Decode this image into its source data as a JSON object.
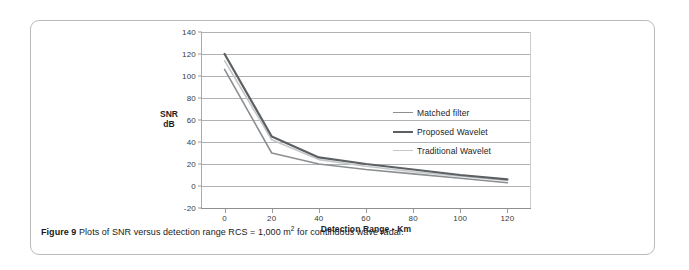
{
  "figure": {
    "caption_label": "Figure 9",
    "caption_text": "Plots of SNR versus detection range RCS = 1,000 m",
    "caption_superscript": "2",
    "caption_tail": " for continuous wave radar."
  },
  "chart_data": {
    "type": "line",
    "title": "",
    "xlabel": "Detection Range - Km",
    "ylabel": "SNR\ndB",
    "ylabel_line1": "SNR",
    "ylabel_line2": "dB",
    "x": [
      0,
      20,
      40,
      60,
      80,
      100,
      120
    ],
    "xlim": [
      -10,
      130
    ],
    "ylim": [
      -20,
      140
    ],
    "xticks": [
      0,
      20,
      40,
      60,
      80,
      100,
      120
    ],
    "yticks": [
      -20,
      0,
      20,
      40,
      60,
      80,
      100,
      120,
      140
    ],
    "grid": "horizontal",
    "legend_position": "inside-right",
    "series": [
      {
        "name": "Matched filter",
        "color": "#8c8f91",
        "width": 1.6,
        "values": [
          106,
          30,
          20,
          15,
          11,
          7,
          3
        ]
      },
      {
        "name": "Proposed Wavelet",
        "color": "#5d6063",
        "width": 2.2,
        "values": [
          120,
          45,
          26,
          20,
          15,
          10,
          6
        ]
      },
      {
        "name": "Traditional Wavelet",
        "color": "#c4c7c9",
        "width": 1.6,
        "values": [
          114,
          42,
          24,
          18,
          13,
          9,
          5
        ]
      }
    ]
  }
}
